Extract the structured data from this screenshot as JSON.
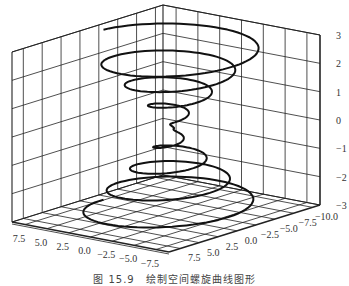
{
  "chart_data": {
    "type": "line3d",
    "title": "",
    "caption": "图 15.9　绘制空间螺旋曲线图形",
    "xlabel": "",
    "ylabel": "",
    "zlabel": "",
    "x_ticks": [
      7.5,
      5.0,
      2.5,
      0.0,
      -2.5,
      -5.0,
      -7.5
    ],
    "x_tick_labels": [
      "7.5",
      "5.0",
      "2.5",
      "0.0",
      "−2.5",
      "−5.0",
      "−7.5"
    ],
    "y_ticks": [
      7.5,
      5.0,
      2.5,
      0.0,
      -2.5,
      -5.0,
      -7.5,
      -10.0
    ],
    "y_tick_labels": [
      "7.5",
      "5.0",
      "2.5",
      "0.0",
      "−2.5",
      "−5.0",
      "−7.5",
      "−10.0"
    ],
    "z_ticks": [
      3,
      2,
      1,
      0,
      -1,
      -2,
      -3
    ],
    "z_tick_labels": [
      "3",
      "2",
      "1",
      "0",
      "−1",
      "−2",
      "−3"
    ],
    "xlim": [
      -9,
      9
    ],
    "ylim": [
      -11,
      9
    ],
    "zlim": [
      -3,
      3
    ],
    "grid": true,
    "line_color": "#111111",
    "grid_color": "#222222",
    "series": [
      {
        "name": "helix",
        "description": "conical spiral: radius |z|*~2.7, z from -3 to 3",
        "param": {
          "t_start": -4,
          "t_end": 4,
          "z_scale": 0.75,
          "r_scale": 2.7,
          "turns_per_unit": 0.5
        }
      }
    ]
  }
}
